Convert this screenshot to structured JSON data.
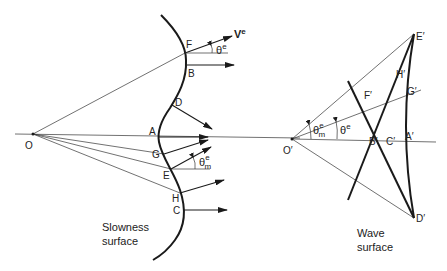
{
  "diagram": {
    "left_panel": {
      "caption_line1": "Slowness",
      "caption_line2": "surface",
      "origin_label": "O",
      "points": {
        "A": "A",
        "B": "B",
        "C": "C",
        "D": "D",
        "E": "E",
        "F": "F",
        "G": "G",
        "H": "H"
      },
      "energy_velocity_label": "V",
      "energy_velocity_sup": "e",
      "angle_label": "θ",
      "angle_sup": "e",
      "max_angle_label": "θ",
      "max_angle_sup": "e",
      "max_angle_sub": "m"
    },
    "right_panel": {
      "caption_line1": "Wave",
      "caption_line2": "surface",
      "origin_label": "O′",
      "points": {
        "A": "A′",
        "B": "B′",
        "C": "C′",
        "D": "D′",
        "E": "E′",
        "F": "F′",
        "G": "G′",
        "H": "H′"
      },
      "angle_label": "θ",
      "angle_sup": "e",
      "max_angle_label": "θ",
      "max_angle_sup": "e",
      "max_angle_sub": "m"
    }
  }
}
